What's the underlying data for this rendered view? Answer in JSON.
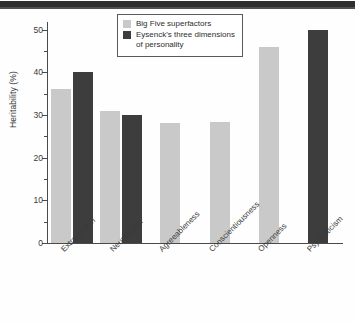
{
  "chart_data": {
    "type": "bar",
    "title": "",
    "xlabel": "",
    "ylabel": "Heritability (%)",
    "ylim": [
      0,
      52
    ],
    "grid": false,
    "legend_position": "top-center",
    "categories": [
      "Extraversion",
      "Neuroticism",
      "Agreeableness",
      "Conscientiousness",
      "Openness",
      "Psychoticism"
    ],
    "series": [
      {
        "name": "Big Five superfactors",
        "color": "#c9c9c9",
        "values": [
          36,
          31,
          28,
          28.3,
          46,
          null
        ]
      },
      {
        "name": "Eysenck's three dimensions of personality",
        "color": "#3d3d3d",
        "values": [
          40,
          30,
          null,
          null,
          null,
          50
        ]
      }
    ],
    "y_ticks_major": [
      0,
      10,
      20,
      30,
      40,
      50
    ],
    "y_ticks_minor": [
      5,
      15,
      25,
      35,
      45
    ],
    "y_tick_labels": [
      "0",
      "10",
      "20",
      "30",
      "40",
      "50"
    ]
  },
  "axes": {
    "y_title": "Heritability (%)"
  },
  "legend": {
    "entries": [
      {
        "label": "Big Five superfactors",
        "swatch": "light-gray-swatch"
      },
      {
        "label": "Eysenck's three dimensions\nof personality",
        "swatch": "dark-gray-swatch"
      }
    ]
  }
}
